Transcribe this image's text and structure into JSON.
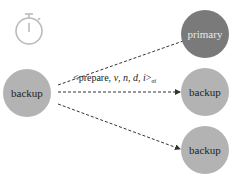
{
  "diagram": {
    "timer_icon": "stopwatch-icon",
    "sender": {
      "label": "backup"
    },
    "receivers": [
      {
        "label": "primary",
        "color": "#7a7a7a",
        "text_color": "#e8e8e8"
      },
      {
        "label": "backup",
        "color": "#b3b3b3",
        "text_color": "#222222"
      },
      {
        "label": "backup",
        "color": "#b3b3b3",
        "text_color": "#222222"
      }
    ],
    "sender_color": "#b3b3b3",
    "message": {
      "prefix": "<prepare, ",
      "v": "v",
      "n": "n",
      "d": "d",
      "i": "i",
      "suffix": ">",
      "subscript": "σi"
    }
  }
}
